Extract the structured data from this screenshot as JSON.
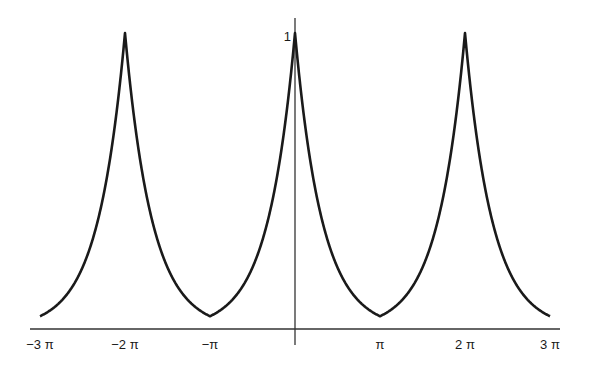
{
  "chart_data": {
    "type": "line",
    "title": "",
    "xlabel": "",
    "ylabel": "",
    "function": "e^(-|x|) periodically extended with period 2π (peaks at 0, ±2π; minima e^(-π)≈0.043 at ±π)",
    "xlim": [
      -9.42,
      9.42
    ],
    "ylim": [
      0,
      1
    ],
    "x_ticks": [
      {
        "value": -9.4248,
        "label": "−3 π"
      },
      {
        "value": -6.2832,
        "label": "−2 π"
      },
      {
        "value": -3.1416,
        "label": "−π"
      },
      {
        "value": 3.1416,
        "label": "π"
      },
      {
        "value": 6.2832,
        "label": "2 π"
      },
      {
        "value": 9.4248,
        "label": "3 π"
      }
    ],
    "y_ticks": [
      {
        "value": 1,
        "label": "1"
      }
    ],
    "key_points": [
      {
        "x": -9.4248,
        "y": 0.043
      },
      {
        "x": -6.2832,
        "y": 1.0
      },
      {
        "x": -3.1416,
        "y": 0.043
      },
      {
        "x": 0,
        "y": 1.0
      },
      {
        "x": 3.1416,
        "y": 0.043
      },
      {
        "x": 6.2832,
        "y": 1.0
      },
      {
        "x": 9.4248,
        "y": 0.043
      }
    ],
    "series": [
      {
        "name": "f(x)",
        "color": "#1a1a1a"
      }
    ],
    "grid": false,
    "legend": null
  },
  "axes": {
    "color": "#333333",
    "curve_color": "#1a1a1a"
  }
}
